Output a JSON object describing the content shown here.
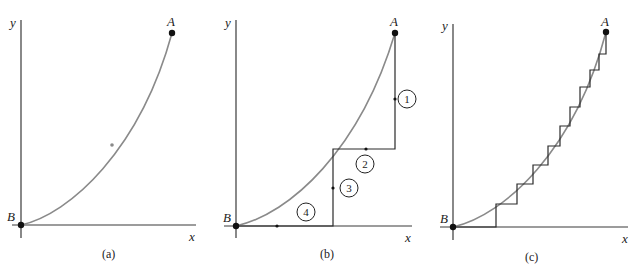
{
  "figure": {
    "panels": [
      {
        "id": "a",
        "caption": "(a)",
        "x_label": "x",
        "y_label": "y",
        "start_point": "A",
        "end_point": "B",
        "description": "Curved path from A down to B (origin)"
      },
      {
        "id": "b",
        "caption": "(b)",
        "x_label": "x",
        "y_label": "y",
        "start_point": "A",
        "end_point": "B",
        "step_labels": [
          "1",
          "2",
          "3",
          "4"
        ],
        "description": "Stepped path A to B: vertical (1), horizontal (2), vertical (3), horizontal (4)"
      },
      {
        "id": "c",
        "caption": "(c)",
        "x_label": "x",
        "y_label": "y",
        "start_point": "A",
        "end_point": "B",
        "description": "Fine staircase of vertical/horizontal steps approximating the curve"
      }
    ]
  },
  "colors": {
    "curve": "#8a8a8a",
    "axis": "#3a3a3a",
    "path": "#2a2a2a",
    "point": "#111111"
  }
}
